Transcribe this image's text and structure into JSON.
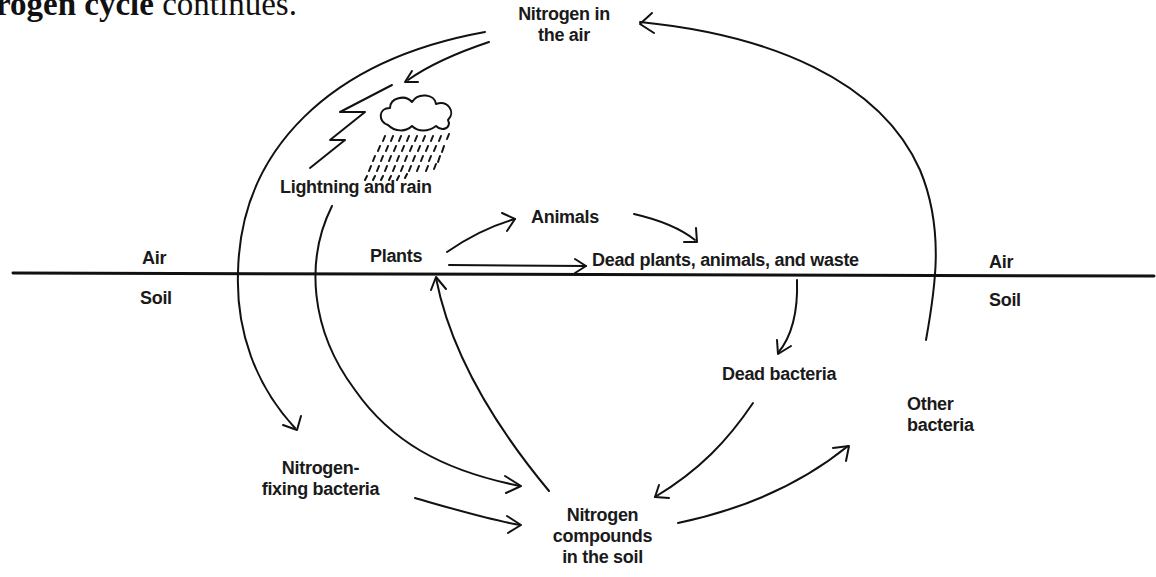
{
  "heading": {
    "bold_part": "rogen cycle",
    "rest": " continues."
  },
  "labels": {
    "nitrogen_air": [
      "Nitrogen in",
      "the air"
    ],
    "lightning_rain": "Lightning and rain",
    "animals": "Animals",
    "plants": "Plants",
    "dead_matter": "Dead plants, animals, and waste",
    "air_left": "Air",
    "soil_left": "Soil",
    "air_right": "Air",
    "soil_right": "Soil",
    "dead_bacteria": "Dead bacteria",
    "other_bacteria": [
      "Other",
      "bacteria"
    ],
    "fixing_bacteria": [
      "Nitrogen-",
      "fixing bacteria"
    ],
    "compounds": [
      "Nitrogen",
      "compounds",
      "in the soil"
    ]
  },
  "icons": [
    "lightning-icon",
    "cloud-icon",
    "rain-icon"
  ],
  "colors": {
    "ink": "#111111",
    "background": "#ffffff"
  }
}
